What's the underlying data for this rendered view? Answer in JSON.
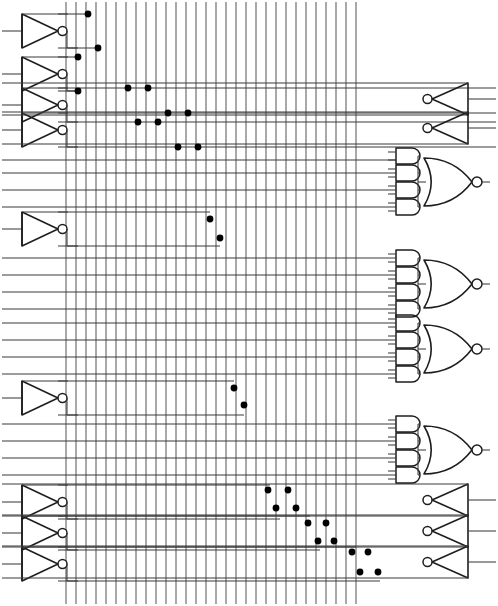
{
  "diagram": {
    "type": "digital-logic-schematic",
    "width": 498,
    "height": 606,
    "background_color": "#ffffff",
    "wire_color": "#3a3a3a",
    "bus_color": "#5a5a5a",
    "gate_color": "#1e1e1e",
    "junction_color": "#000000"
  },
  "vertical_bus": {
    "name": "vertical-bus-matrix",
    "count": 30,
    "y_top": 2,
    "y_bottom": 604,
    "x_positions": [
      66,
      76,
      86,
      96,
      106,
      116,
      126,
      136,
      146,
      156,
      166,
      176,
      186,
      196,
      206,
      216,
      226,
      236,
      246,
      256,
      266,
      276,
      286,
      296,
      306,
      316,
      326,
      336,
      346,
      356
    ]
  },
  "left_inverters": [
    {
      "id": "inv-l1",
      "x": 22,
      "y": 14,
      "w": 36,
      "h": 34,
      "in_y": 31,
      "out_true_y": 14,
      "out_bar_y": 48
    },
    {
      "id": "inv-l2",
      "x": 22,
      "y": 57,
      "w": 36,
      "h": 34,
      "in_y": 74,
      "out_true_y": 57,
      "out_bar_y": 91
    },
    {
      "id": "inv-l3",
      "x": 22,
      "y": 88,
      "w": 36,
      "h": 34,
      "in_y": 105,
      "out_true_y": 88,
      "out_bar_y": 122
    },
    {
      "id": "inv-l4",
      "x": 22,
      "y": 113,
      "w": 36,
      "h": 34,
      "in_y": 130,
      "out_true_y": 113,
      "out_bar_y": 147
    },
    {
      "id": "inv-l5",
      "x": 22,
      "y": 212,
      "w": 36,
      "h": 34,
      "in_y": 229,
      "out_true_y": 212,
      "out_bar_y": 246
    },
    {
      "id": "inv-l6",
      "x": 22,
      "y": 381,
      "w": 36,
      "h": 34,
      "in_y": 398,
      "out_true_y": 381,
      "out_bar_y": 415
    },
    {
      "id": "inv-l7",
      "x": 22,
      "y": 485,
      "w": 36,
      "h": 34,
      "in_y": 502,
      "out_true_y": 485,
      "out_bar_y": 519
    },
    {
      "id": "inv-l8",
      "x": 22,
      "y": 516,
      "w": 36,
      "h": 34,
      "in_y": 533,
      "out_true_y": 516,
      "out_bar_y": 550
    },
    {
      "id": "inv-l9",
      "x": 22,
      "y": 547,
      "w": 36,
      "h": 34,
      "in_y": 564,
      "out_true_y": 547,
      "out_bar_y": 581
    }
  ],
  "right_inverters": [
    {
      "id": "inv-r1",
      "x": 432,
      "y": 83,
      "w": 36,
      "h": 32,
      "out_y": 99,
      "in_true_y": 83,
      "in_bar_y": 115
    },
    {
      "id": "inv-r2",
      "x": 432,
      "y": 112,
      "w": 36,
      "h": 32,
      "out_y": 128,
      "in_true_y": 112,
      "in_bar_y": 144
    },
    {
      "id": "inv-r3",
      "x": 432,
      "y": 484,
      "w": 36,
      "h": 32,
      "out_y": 500,
      "in_true_y": 484,
      "in_bar_y": 516
    },
    {
      "id": "inv-r4",
      "x": 432,
      "y": 515,
      "w": 36,
      "h": 32,
      "out_y": 531,
      "in_true_y": 515,
      "in_bar_y": 547
    },
    {
      "id": "inv-r5",
      "x": 432,
      "y": 546,
      "w": 36,
      "h": 32,
      "out_y": 562,
      "in_true_y": 546,
      "in_bar_y": 578
    }
  ],
  "decode_blocks": [
    {
      "id": "decode-1",
      "label": "AND4-NOR-1",
      "and_x": 396,
      "and_w": 24,
      "and_h": 16,
      "and_ys": [
        156,
        173,
        190,
        207
      ],
      "nor_x": 424,
      "nor_y": 158,
      "nor_w": 48,
      "nor_h": 48,
      "out_y": 182,
      "out_x_end": 490
    },
    {
      "id": "decode-2",
      "label": "AND4-NOR-2",
      "and_x": 396,
      "and_w": 24,
      "and_h": 16,
      "and_ys": [
        258,
        275,
        292,
        309
      ],
      "nor_x": 424,
      "nor_y": 260,
      "nor_w": 48,
      "nor_h": 48,
      "out_y": 284,
      "out_x_end": 490
    },
    {
      "id": "decode-3",
      "label": "AND4-NOR-3",
      "and_x": 396,
      "and_w": 24,
      "and_h": 16,
      "and_ys": [
        323,
        340,
        357,
        374
      ],
      "nor_x": 424,
      "nor_y": 325,
      "nor_w": 48,
      "nor_h": 48,
      "out_y": 349,
      "out_x_end": 490
    },
    {
      "id": "decode-4",
      "label": "AND4-NOR-4",
      "and_x": 396,
      "and_w": 24,
      "and_h": 16,
      "and_ys": [
        424,
        441,
        458,
        475
      ],
      "nor_x": 424,
      "nor_y": 426,
      "nor_w": 48,
      "nor_h": 48,
      "out_y": 450,
      "out_x_end": 490
    }
  ],
  "horizontal_rails": [
    {
      "id": "rail-1",
      "y": 14,
      "x1": 58,
      "x2": 88
    },
    {
      "id": "rail-2",
      "y": 48,
      "x1": 58,
      "x2": 98
    },
    {
      "id": "rail-3",
      "y": 57,
      "x1": 58,
      "x2": 78
    },
    {
      "id": "rail-4",
      "y": 91,
      "x1": 58,
      "x2": 78
    },
    {
      "id": "rail-5",
      "y": 88,
      "x1": 58,
      "x2": 496
    },
    {
      "id": "rail-6",
      "y": 122,
      "x1": 58,
      "x2": 496
    },
    {
      "id": "rail-7",
      "y": 113,
      "x1": 58,
      "x2": 496
    },
    {
      "id": "rail-8",
      "y": 147,
      "x1": 58,
      "x2": 496
    },
    {
      "id": "rail-9",
      "y": 160,
      "x1": 2,
      "x2": 396
    },
    {
      "id": "rail-10",
      "y": 173,
      "x1": 2,
      "x2": 396
    },
    {
      "id": "rail-11",
      "y": 190,
      "x1": 2,
      "x2": 396
    },
    {
      "id": "rail-12",
      "y": 207,
      "x1": 2,
      "x2": 396
    },
    {
      "id": "rail-13",
      "y": 212,
      "x1": 58,
      "x2": 210
    },
    {
      "id": "rail-14",
      "y": 246,
      "x1": 58,
      "x2": 220
    },
    {
      "id": "rail-15",
      "y": 258,
      "x1": 2,
      "x2": 396
    },
    {
      "id": "rail-16",
      "y": 275,
      "x1": 2,
      "x2": 396
    },
    {
      "id": "rail-17",
      "y": 292,
      "x1": 2,
      "x2": 396
    },
    {
      "id": "rail-18",
      "y": 309,
      "x1": 2,
      "x2": 396
    },
    {
      "id": "rail-19",
      "y": 323,
      "x1": 2,
      "x2": 396
    },
    {
      "id": "rail-20",
      "y": 340,
      "x1": 2,
      "x2": 396
    },
    {
      "id": "rail-21",
      "y": 357,
      "x1": 2,
      "x2": 396
    },
    {
      "id": "rail-22",
      "y": 374,
      "x1": 2,
      "x2": 396
    },
    {
      "id": "rail-23",
      "y": 381,
      "x1": 58,
      "x2": 234
    },
    {
      "id": "rail-24",
      "y": 415,
      "x1": 58,
      "x2": 244
    },
    {
      "id": "rail-25",
      "y": 424,
      "x1": 2,
      "x2": 396
    },
    {
      "id": "rail-26",
      "y": 441,
      "x1": 2,
      "x2": 396
    },
    {
      "id": "rail-27",
      "y": 458,
      "x1": 2,
      "x2": 396
    },
    {
      "id": "rail-28",
      "y": 475,
      "x1": 2,
      "x2": 396
    },
    {
      "id": "rail-29",
      "y": 485,
      "x1": 58,
      "x2": 270
    },
    {
      "id": "rail-30",
      "y": 519,
      "x1": 58,
      "x2": 280
    },
    {
      "id": "rail-31",
      "y": 516,
      "x1": 58,
      "x2": 310
    },
    {
      "id": "rail-32",
      "y": 550,
      "x1": 58,
      "x2": 320
    },
    {
      "id": "rail-33",
      "y": 547,
      "x1": 58,
      "x2": 356
    },
    {
      "id": "rail-34",
      "y": 581,
      "x1": 58,
      "x2": 380
    }
  ],
  "junctions": [
    {
      "x": 88,
      "y": 14
    },
    {
      "x": 98,
      "y": 48
    },
    {
      "x": 78,
      "y": 57
    },
    {
      "x": 78,
      "y": 91
    },
    {
      "x": 128,
      "y": 88
    },
    {
      "x": 148,
      "y": 88
    },
    {
      "x": 138,
      "y": 122
    },
    {
      "x": 158,
      "y": 122
    },
    {
      "x": 168,
      "y": 113
    },
    {
      "x": 188,
      "y": 113
    },
    {
      "x": 178,
      "y": 147
    },
    {
      "x": 198,
      "y": 147
    },
    {
      "x": 210,
      "y": 219
    },
    {
      "x": 220,
      "y": 238
    },
    {
      "x": 234,
      "y": 388
    },
    {
      "x": 244,
      "y": 405
    },
    {
      "x": 268,
      "y": 490
    },
    {
      "x": 288,
      "y": 490
    },
    {
      "x": 276,
      "y": 508
    },
    {
      "x": 296,
      "y": 508
    },
    {
      "x": 308,
      "y": 523
    },
    {
      "x": 326,
      "y": 523
    },
    {
      "x": 318,
      "y": 541
    },
    {
      "x": 334,
      "y": 541
    },
    {
      "x": 352,
      "y": 552
    },
    {
      "x": 368,
      "y": 552
    },
    {
      "x": 360,
      "y": 572
    },
    {
      "x": 378,
      "y": 572
    }
  ],
  "legend": {
    "inverter": "NOT gate (buffer triangle with inverting bubble)",
    "and_gate": "2-input AND gate (D shape)",
    "nor_gate": "4-input NOR gate (OR shield with output bubble)",
    "junction": "wire connection dot",
    "bus": "vertical signal bus line"
  }
}
